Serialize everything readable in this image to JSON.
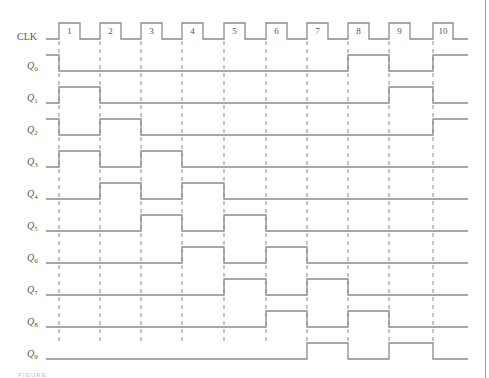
{
  "diagram": {
    "type": "timing-diagram",
    "clock": {
      "label": "CLK",
      "pulse_numbers": [
        "1",
        "2",
        "3",
        "4",
        "5",
        "6",
        "7",
        "8",
        "9",
        "10"
      ]
    },
    "signals": [
      {
        "label": "Q",
        "sub": "0",
        "initial": 1,
        "levels_after_edges": [
          0,
          0,
          0,
          0,
          0,
          0,
          0,
          1,
          0,
          1
        ]
      },
      {
        "label": "Q",
        "sub": "1",
        "initial": 0,
        "levels_after_edges": [
          1,
          0,
          0,
          0,
          0,
          0,
          0,
          0,
          1,
          0
        ]
      },
      {
        "label": "Q",
        "sub": "2",
        "initial": 1,
        "levels_after_edges": [
          0,
          1,
          0,
          0,
          0,
          0,
          0,
          0,
          0,
          1
        ]
      },
      {
        "label": "Q",
        "sub": "3",
        "initial": 0,
        "levels_after_edges": [
          1,
          0,
          1,
          0,
          0,
          0,
          0,
          0,
          0,
          0
        ]
      },
      {
        "label": "Q",
        "sub": "4",
        "initial": 0,
        "levels_after_edges": [
          0,
          1,
          0,
          1,
          0,
          0,
          0,
          0,
          0,
          0
        ]
      },
      {
        "label": "Q",
        "sub": "5",
        "initial": 0,
        "levels_after_edges": [
          0,
          0,
          1,
          0,
          1,
          0,
          0,
          0,
          0,
          0
        ]
      },
      {
        "label": "Q",
        "sub": "6",
        "initial": 0,
        "levels_after_edges": [
          0,
          0,
          0,
          1,
          0,
          1,
          0,
          0,
          0,
          0
        ]
      },
      {
        "label": "Q",
        "sub": "7",
        "initial": 0,
        "levels_after_edges": [
          0,
          0,
          0,
          0,
          1,
          0,
          1,
          0,
          0,
          0
        ]
      },
      {
        "label": "Q",
        "sub": "8",
        "initial": 0,
        "levels_after_edges": [
          0,
          0,
          0,
          0,
          0,
          1,
          0,
          1,
          0,
          0
        ]
      },
      {
        "label": "Q",
        "sub": "9",
        "initial": 0,
        "levels_after_edges": [
          0,
          0,
          0,
          0,
          0,
          0,
          1,
          0,
          1,
          0
        ]
      }
    ],
    "colors": {
      "line": "#8a8a8a",
      "text": "#555555"
    }
  },
  "caption": "FIGURE"
}
